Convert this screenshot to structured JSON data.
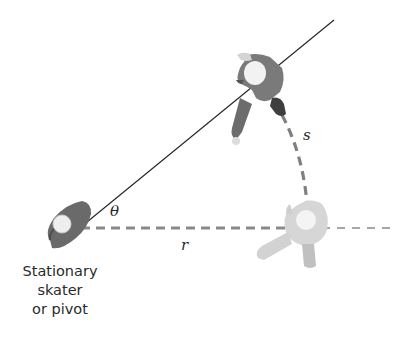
{
  "diagram": {
    "labels": {
      "theta": "θ",
      "radius": "r",
      "arc_length": "s"
    },
    "pivot_caption": [
      "Stationary",
      "skater",
      "or pivot"
    ],
    "colors": {
      "line": "#222222",
      "dashed": "#808080",
      "pivot_skater": "#6e6e6e",
      "moving_skater_start": "#7a7a7a",
      "moving_skater_end": "#d8d8d8"
    }
  }
}
